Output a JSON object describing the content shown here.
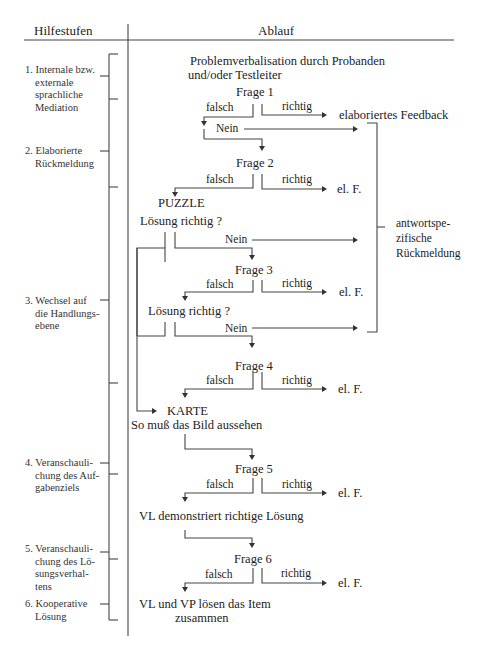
{
  "header": {
    "left_title": "Hilfestufen",
    "right_title": "Ablauf"
  },
  "help_levels": [
    {
      "number": "1.",
      "lines": [
        "Internale bzw.",
        "externale",
        "sprachliche",
        "Mediation"
      ]
    },
    {
      "number": "2.",
      "lines": [
        "Elaborierte",
        "Rückmeldung"
      ]
    },
    {
      "number": "3.",
      "lines": [
        "Wechsel auf",
        "die Handlungs-",
        "ebene"
      ]
    },
    {
      "number": "4.",
      "lines": [
        "Veranschauli-",
        "chung des Auf-",
        "gabenziels"
      ]
    },
    {
      "number": "5.",
      "lines": [
        "Veranschauli-",
        "chung des Lö-",
        "sungsverhal-",
        "tens"
      ]
    },
    {
      "number": "6.",
      "lines": [
        "Kooperative",
        "Lösung"
      ]
    }
  ],
  "flow": {
    "intro_line1": "Problemverbalisation durch Probanden",
    "intro_line2": "und/oder Testleiter",
    "frage1": "Frage 1",
    "frage2": "Frage 2",
    "frage3": "Frage 3",
    "frage4": "Frage 4",
    "frage5": "Frage 5",
    "frage6": "Frage 6",
    "falsch": "falsch",
    "richtig": "richtig",
    "nein": "Nein",
    "elaborated_feedback": "elaboriertes Feedback",
    "el_f": "el. F.",
    "puzzle": "PUZZLE",
    "loesung_richtig": "Lösung richtig ?",
    "karte": "KARTE",
    "so_muss": "So muß das Bild aussehen",
    "vl_demonstriert": "VL demonstriert richtige Lösung",
    "vl_vp_line1": "VL und VP lösen das Item",
    "vl_vp_line2": "zusammen"
  },
  "right_bracket": {
    "lines": [
      "antwortspe-",
      "zifische",
      "Rückmeldung"
    ]
  }
}
